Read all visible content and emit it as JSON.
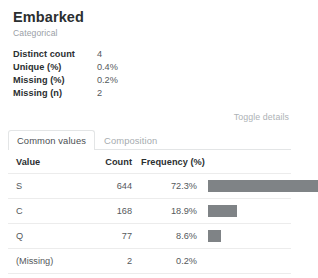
{
  "variable": {
    "name": "Embarked",
    "type": "Categorical"
  },
  "stats": [
    {
      "label": "Distinct count",
      "value": "4"
    },
    {
      "label": "Unique (%)",
      "value": "0.4%"
    },
    {
      "label": "Missing (%)",
      "value": "0.2%"
    },
    {
      "label": "Missing (n)",
      "value": "2"
    }
  ],
  "toggle": {
    "label": "Toggle details"
  },
  "tabs": [
    {
      "label": "Common values",
      "active": true
    },
    {
      "label": "Composition",
      "active": false
    }
  ],
  "table": {
    "headers": {
      "value": "Value",
      "count": "Count",
      "frequency": "Frequency (%)"
    },
    "rows": [
      {
        "value": "S",
        "count": "644",
        "frequency": "72.3%",
        "pct": 72.3
      },
      {
        "value": "C",
        "count": "168",
        "frequency": "18.9%",
        "pct": 18.9
      },
      {
        "value": "Q",
        "count": "77",
        "frequency": "8.6%",
        "pct": 8.6
      },
      {
        "value": "(Missing)",
        "count": "2",
        "frequency": "0.2%",
        "pct": 0.2
      }
    ]
  },
  "chart_data": {
    "type": "bar",
    "xlabel": "Frequency (%)",
    "ylabel": "Value",
    "categories": [
      "S",
      "C",
      "Q",
      "(Missing)"
    ],
    "values": [
      72.3,
      18.9,
      8.6,
      0.2
    ],
    "counts": [
      644,
      168,
      77,
      2
    ],
    "xlim": [
      0,
      72.3
    ],
    "grid": false,
    "legend": null,
    "orientation": "horizontal",
    "bar_color": "#7f8386"
  },
  "colors": {
    "bar": "#7f8386",
    "text": "#373a3c",
    "muted": "#9aa0a6",
    "border": "#e3e5e6",
    "row_divider": "#ececec"
  }
}
